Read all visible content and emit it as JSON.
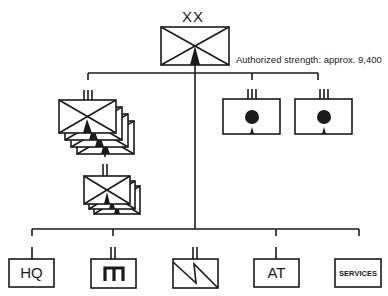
{
  "division": {
    "echelon": "XX",
    "type": "mechanized-infantry-division",
    "note": "Authorized strength: approx. 9,400"
  },
  "regiments": {
    "echelon": "III",
    "type": "mechanized-infantry-regiment",
    "stack_count": 4
  },
  "battalions": {
    "echelon": "II",
    "type": "mechanized-infantry-battalion",
    "stack_count": 3
  },
  "artillery_regiments": [
    {
      "echelon": "III",
      "type": "self-propelled-artillery-regiment"
    },
    {
      "echelon": "III",
      "type": "self-propelled-artillery-regiment"
    }
  ],
  "support_units": [
    {
      "label": "HQ",
      "type": "headquarters",
      "echelon": "I"
    },
    {
      "label": "",
      "type": "engineer",
      "echelon": "II",
      "symbol": "engineer-icon"
    },
    {
      "label": "",
      "type": "signal",
      "echelon": "II",
      "symbol": "signal-icon"
    },
    {
      "label": "AT",
      "type": "anti-tank",
      "echelon": "I"
    },
    {
      "label": "SERVICES",
      "type": "services",
      "echelon": ""
    }
  ],
  "colors": {
    "line": "#1a1a1a",
    "background": "#ffffff"
  }
}
